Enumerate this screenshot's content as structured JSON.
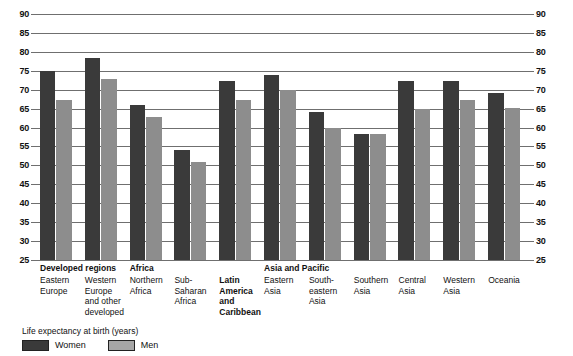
{
  "chart_data": {
    "type": "bar",
    "title": "",
    "xlabel": "",
    "ylabel": "Life expectancy at birth (years)",
    "ylim": [
      25,
      90
    ],
    "ytick_step": 5,
    "grid": true,
    "legend_position": "bottom-left",
    "categories": [
      "Eastern Europe",
      "Western Europe and other developed",
      "Northern Africa",
      "Sub-Saharan Africa",
      "Latin America and Caribbean",
      "Eastern Asia",
      "South-eastern Asia",
      "Southern Asia",
      "Central Asia",
      "Western Asia",
      "Oceania"
    ],
    "series": [
      {
        "name": "Women",
        "color": "#3a3a3a",
        "values": [
          75.0,
          78.5,
          66.0,
          54.0,
          72.2,
          74.0,
          64.0,
          58.4,
          72.2,
          72.3,
          69.0
        ]
      },
      {
        "name": "Men",
        "color": "#8d8d8d",
        "values": [
          67.4,
          72.8,
          62.7,
          51.0,
          67.2,
          70.0,
          60.0,
          58.3,
          64.8,
          67.2,
          65.2
        ]
      }
    ],
    "ytick_labels": [
      "90",
      "85",
      "80",
      "75",
      "70",
      "65",
      "60",
      "55",
      "50",
      "45",
      "40",
      "35",
      "30",
      "25"
    ]
  },
  "axis": {
    "ticks": [
      {
        "value": 90,
        "label": "90"
      },
      {
        "value": 85,
        "label": "85"
      },
      {
        "value": 80,
        "label": "80"
      },
      {
        "value": 75,
        "label": "75"
      },
      {
        "value": 70,
        "label": "70"
      },
      {
        "value": 65,
        "label": "65"
      },
      {
        "value": 60,
        "label": "60"
      },
      {
        "value": 55,
        "label": "55"
      },
      {
        "value": 50,
        "label": "50"
      },
      {
        "value": 45,
        "label": "45"
      },
      {
        "value": 40,
        "label": "40"
      },
      {
        "value": 35,
        "label": "35"
      },
      {
        "value": 30,
        "label": "30"
      },
      {
        "value": 25,
        "label": "25"
      }
    ]
  },
  "groups": [
    {
      "header": "Developed regions",
      "header_visible": true,
      "header_span": 2,
      "sub_lines": [
        "Eastern",
        "Europe"
      ],
      "sub_bold": false,
      "women": 75.0,
      "men": 67.4
    },
    {
      "header": "",
      "header_visible": false,
      "sub_lines": [
        "Western",
        "Europe",
        "and other",
        "developed"
      ],
      "sub_bold": false,
      "women": 78.5,
      "men": 72.8
    },
    {
      "header": "Africa",
      "header_visible": true,
      "header_span": 2,
      "sub_lines": [
        "Northern",
        "Africa"
      ],
      "sub_bold": false,
      "women": 66.0,
      "men": 62.7
    },
    {
      "header": "",
      "header_visible": false,
      "sub_lines": [
        "Sub-",
        "Saharan",
        "Africa"
      ],
      "sub_bold": false,
      "women": 54.0,
      "men": 51.0
    },
    {
      "header": "",
      "header_visible": false,
      "sub_lines": [
        "Latin",
        "America",
        "and",
        "Caribbean"
      ],
      "sub_bold": true,
      "women": 72.2,
      "men": 67.2
    },
    {
      "header": "Asia and Pacific",
      "header_visible": true,
      "header_span": 6,
      "sub_lines": [
        "Eastern",
        "Asia"
      ],
      "sub_bold": false,
      "women": 74.0,
      "men": 70.0
    },
    {
      "header": "",
      "header_visible": false,
      "sub_lines": [
        "South-",
        "eastern",
        "Asia"
      ],
      "sub_bold": false,
      "women": 64.0,
      "men": 60.0
    },
    {
      "header": "",
      "header_visible": false,
      "sub_lines": [
        "Southern",
        "Asia"
      ],
      "sub_bold": false,
      "women": 58.4,
      "men": 58.3
    },
    {
      "header": "",
      "header_visible": false,
      "sub_lines": [
        "Central",
        "Asia"
      ],
      "sub_bold": false,
      "women": 72.2,
      "men": 64.8
    },
    {
      "header": "",
      "header_visible": false,
      "sub_lines": [
        "Western",
        "Asia"
      ],
      "sub_bold": false,
      "women": 72.3,
      "men": 67.2
    },
    {
      "header": "",
      "header_visible": false,
      "sub_lines": [
        "Oceania"
      ],
      "sub_bold": false,
      "women": 69.0,
      "men": 65.2
    }
  ],
  "legend": {
    "title": "Life expectancy at birth (years)",
    "items": [
      {
        "label": "Women",
        "color": "#3a3a3a"
      },
      {
        "label": "Men",
        "color": "#a6a6a6"
      }
    ]
  }
}
